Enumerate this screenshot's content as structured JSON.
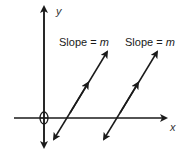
{
  "diagram": {
    "type": "coordinate-plane-parallel-lines",
    "axes": {
      "x_label": "x",
      "y_label": "y"
    },
    "lines": [
      {
        "label_prefix": "Slope = ",
        "label_var": "m"
      },
      {
        "label_prefix": "Slope = ",
        "label_var": "m"
      }
    ],
    "colors": {
      "stroke": "#1a1a1a",
      "background": "#ffffff"
    }
  }
}
